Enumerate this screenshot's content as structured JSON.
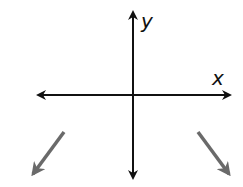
{
  "diagram": {
    "type": "coordinate-axes",
    "axes": {
      "x_label": "x",
      "y_label": "y",
      "color": "#111111"
    },
    "end_behavior_arrows": [
      {
        "position": "lower-left",
        "direction": "down-left",
        "color": "#666666"
      },
      {
        "position": "lower-right",
        "direction": "down-right",
        "color": "#666666"
      }
    ]
  }
}
